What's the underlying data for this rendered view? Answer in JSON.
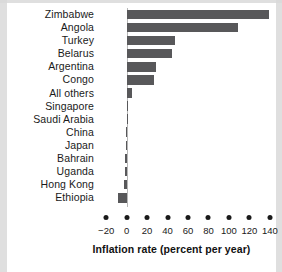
{
  "chart_data": {
    "type": "bar",
    "orientation": "horizontal",
    "title": "",
    "xlabel": "Inflation rate (percent per year)",
    "ylabel": "",
    "xlim": [
      -28,
      146
    ],
    "xticks": [
      -20,
      0,
      20,
      40,
      60,
      80,
      100,
      120,
      140
    ],
    "xtick_labels": [
      "−20",
      "0",
      "20",
      "40",
      "60",
      "80",
      "100",
      "120",
      "140"
    ],
    "grid": false,
    "legend": null,
    "bar_color": "#58585a",
    "axis_color": "#b7b7b7",
    "text_color": "#1a1a1a",
    "categories": [
      "Zimbabwe",
      "Angola",
      "Turkey",
      "Belarus",
      "Argentina",
      "Congo",
      "All others",
      "Singapore",
      "Saudi Arabia",
      "China",
      "Japan",
      "Bahrain",
      "Uganda",
      "Hong Kong",
      "Ethiopia"
    ],
    "values": [
      139,
      109,
      47,
      44,
      29,
      27,
      5,
      0.4,
      0.3,
      -0.8,
      -0.9,
      -1.2,
      -1.6,
      -2.6,
      -8
    ]
  }
}
